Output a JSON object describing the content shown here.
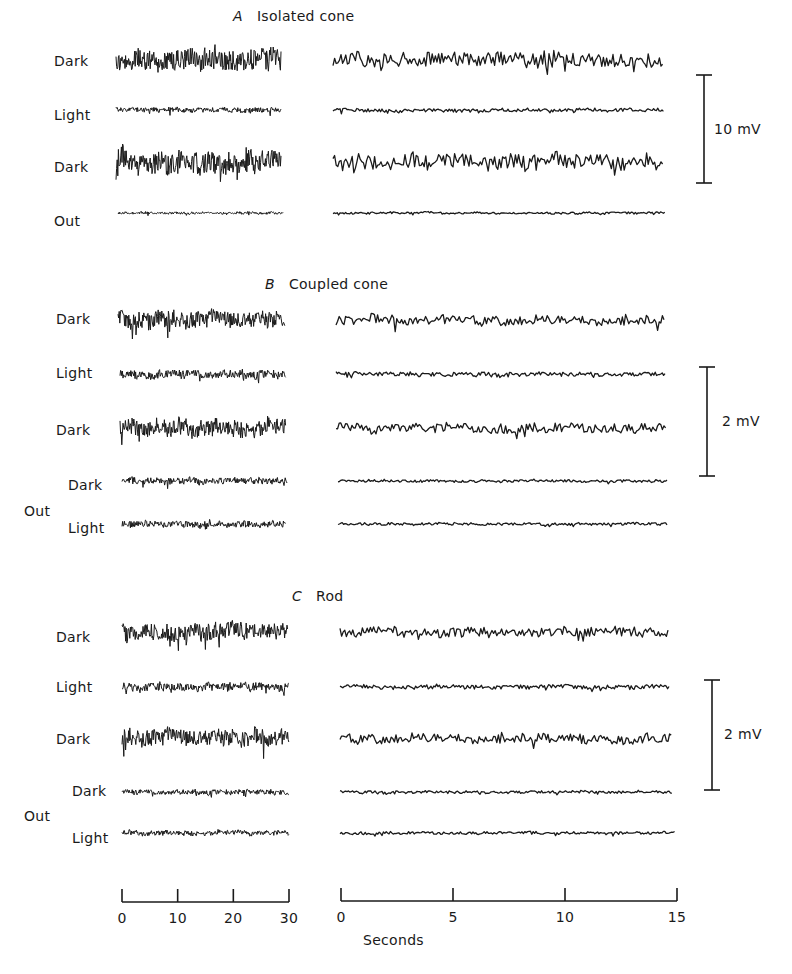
{
  "figure": {
    "panels": [
      {
        "id": "A",
        "letter": "A",
        "title": "Isolated cone",
        "title_pos": [
          233,
          8
        ],
        "scale_bar": {
          "label": "10 mV",
          "x": 704,
          "y1": 75,
          "y2": 183,
          "label_pos": [
            714,
            121
          ]
        },
        "rows": [
          {
            "label": "Dark",
            "label_pos": [
              54,
              53
            ],
            "y": 60,
            "left": [
              116,
              281
            ],
            "right": [
              333,
              664
            ],
            "amp_l": 13,
            "amp_r": 11,
            "style": "big"
          },
          {
            "label": "Light",
            "label_pos": [
              54,
              107
            ],
            "y": 110,
            "left": [
              116,
              281
            ],
            "right": [
              333,
              664
            ],
            "amp_l": 3,
            "amp_r": 2.5,
            "style": "small"
          },
          {
            "label": "Dark",
            "label_pos": [
              54,
              159
            ],
            "y": 162,
            "left": [
              116,
              281
            ],
            "right": [
              333,
              664
            ],
            "amp_l": 13,
            "amp_r": 11,
            "style": "big"
          },
          {
            "label": "Out",
            "label_pos": [
              54,
              213
            ],
            "y": 213,
            "left": [
              118,
              283
            ],
            "right": [
              333,
              665
            ],
            "amp_l": 1.5,
            "amp_r": 1.5,
            "style": "flat"
          }
        ]
      },
      {
        "id": "B",
        "letter": "B",
        "title": "Coupled cone",
        "title_pos": [
          265,
          276
        ],
        "scale_bar": {
          "label": "2 mV",
          "x": 707,
          "y1": 367,
          "y2": 476,
          "label_pos": [
            722,
            413
          ]
        },
        "rows": [
          {
            "label": "Dark",
            "label_pos": [
              56,
              311
            ],
            "y": 320,
            "left": [
              118,
              285
            ],
            "right": [
              336,
              665
            ],
            "amp_l": 10,
            "amp_r": 7,
            "style": "big"
          },
          {
            "label": "Light",
            "label_pos": [
              56,
              365
            ],
            "y": 374,
            "left": [
              120,
              286
            ],
            "right": [
              336,
              665
            ],
            "amp_l": 5,
            "amp_r": 3,
            "style": "mid"
          },
          {
            "label": "Dark",
            "label_pos": [
              56,
              422
            ],
            "y": 428,
            "left": [
              120,
              286
            ],
            "right": [
              336,
              667
            ],
            "amp_l": 10,
            "amp_r": 7,
            "style": "big"
          },
          {
            "label": "Dark",
            "label_pos": [
              68,
              477
            ],
            "y": 481,
            "left": [
              122,
              287
            ],
            "right": [
              338,
              667
            ],
            "amp_l": 4,
            "amp_r": 2,
            "style": "mid"
          },
          {
            "label": "Light",
            "label_pos": [
              68,
              520
            ],
            "y": 524,
            "left": [
              122,
              286
            ],
            "right": [
              338,
              668
            ],
            "amp_l": 4,
            "amp_r": 2,
            "style": "mid"
          }
        ],
        "group_label": {
          "text": "Out",
          "pos": [
            24,
            503
          ]
        }
      },
      {
        "id": "C",
        "letter": "C",
        "title": "Rod",
        "title_pos": [
          292,
          588
        ],
        "scale_bar": {
          "label": "2 mV",
          "x": 712,
          "y1": 680,
          "y2": 790,
          "label_pos": [
            724,
            726
          ]
        },
        "rows": [
          {
            "label": "Dark",
            "label_pos": [
              56,
              629
            ],
            "y": 632,
            "left": [
              122,
              288
            ],
            "right": [
              340,
              669
            ],
            "amp_l": 10,
            "amp_r": 7,
            "style": "big"
          },
          {
            "label": "Light",
            "label_pos": [
              56,
              679
            ],
            "y": 687,
            "left": [
              122,
              289
            ],
            "right": [
              340,
              670
            ],
            "amp_l": 5,
            "amp_r": 3,
            "style": "mid"
          },
          {
            "label": "Dark",
            "label_pos": [
              56,
              731
            ],
            "y": 738,
            "left": [
              122,
              289
            ],
            "right": [
              340,
              672
            ],
            "amp_l": 10,
            "amp_r": 7,
            "style": "big"
          },
          {
            "label": "Dark",
            "label_pos": [
              72,
              783
            ],
            "y": 792,
            "left": [
              122,
              289
            ],
            "right": [
              340,
              672
            ],
            "amp_l": 3,
            "amp_r": 2,
            "style": "mid"
          },
          {
            "label": "Light",
            "label_pos": [
              72,
              830
            ],
            "y": 833,
            "left": [
              122,
              289
            ],
            "right": [
              340,
              675
            ],
            "amp_l": 3,
            "amp_r": 2,
            "style": "mid"
          }
        ],
        "group_label": {
          "text": "Out",
          "pos": [
            24,
            808
          ]
        }
      }
    ],
    "time_axes": [
      {
        "x1": 122,
        "x2": 289,
        "y": 902,
        "ticks": [
          0,
          10,
          20,
          30
        ],
        "unit_range": [
          0,
          30
        ]
      },
      {
        "x1": 341,
        "x2": 677,
        "y": 901,
        "ticks": [
          0,
          5,
          10,
          15
        ],
        "unit_range": [
          0,
          15
        ]
      }
    ],
    "xlabel": "Seconds",
    "xlabel_pos": [
      363,
      932
    ]
  },
  "chart_data": {
    "type": "line",
    "xlabel": "Seconds",
    "panels": [
      {
        "name": "A Isolated cone",
        "scale_bar": "10 mV",
        "traces": [
          "Dark",
          "Light",
          "Dark",
          "Out"
        ]
      },
      {
        "name": "B Coupled cone",
        "scale_bar": "2 mV",
        "traces": [
          "Dark",
          "Light",
          "Dark",
          "Out Dark",
          "Out Light"
        ]
      },
      {
        "name": "C Rod",
        "scale_bar": "2 mV",
        "traces": [
          "Dark",
          "Light",
          "Dark",
          "Out Dark",
          "Out Light"
        ]
      }
    ],
    "x_axes": [
      {
        "position": "left (slow sweep)",
        "ticks": [
          0,
          10,
          20,
          30
        ],
        "range": [
          0,
          30
        ]
      },
      {
        "position": "right (fast sweep)",
        "ticks": [
          0,
          5,
          10,
          15
        ],
        "range": [
          0,
          15
        ]
      }
    ],
    "grid": false,
    "legend": "none"
  }
}
